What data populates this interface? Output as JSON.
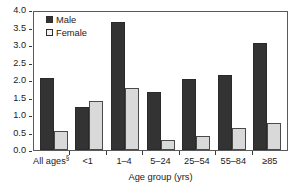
{
  "chart_data": {
    "type": "bar",
    "title": "",
    "xlabel": "Age group (yrs)",
    "ylabel": "Deaths per 100,000 population",
    "categories": [
      "All ages§",
      "<1",
      "1–4",
      "5–24",
      "25–54",
      "55–84",
      "≥85"
    ],
    "series": [
      {
        "name": "Male",
        "color": "#333333",
        "values": [
          2.05,
          1.22,
          3.67,
          1.66,
          2.03,
          2.15,
          3.06
        ]
      },
      {
        "name": "Female",
        "color": "#d9d9d9",
        "values": [
          0.53,
          1.39,
          1.77,
          0.3,
          0.41,
          0.63,
          0.78
        ]
      }
    ],
    "ylim": [
      0.0,
      4.0
    ],
    "yticks": [
      "0.0",
      "0.5",
      "1.0",
      "1.5",
      "2.0",
      "2.5",
      "3.0",
      "3.5",
      "4.0"
    ],
    "ytick_values": [
      0.0,
      0.5,
      1.0,
      1.5,
      2.0,
      2.5,
      3.0,
      3.5,
      4.0
    ],
    "grid": false,
    "legend_position": "top-left",
    "footnote_marker": "§"
  },
  "legend": {
    "items": [
      {
        "label": "Male"
      },
      {
        "label": "Female"
      }
    ]
  },
  "axes": {
    "y_title": "Deaths per 100,000 population",
    "x_title": "Age group (yrs)"
  }
}
